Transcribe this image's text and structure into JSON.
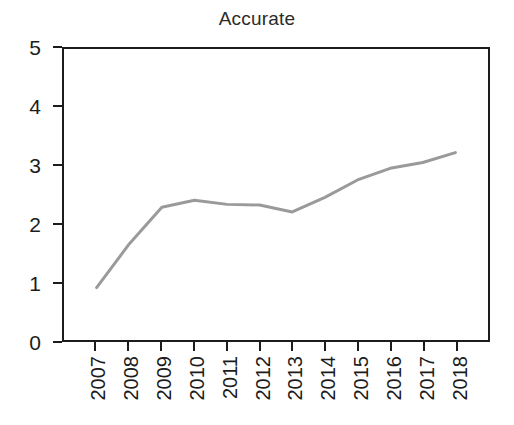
{
  "chart_data": {
    "type": "line",
    "title": "Accurate",
    "xlabel": "",
    "ylabel": "",
    "categories": [
      "2007",
      "2008",
      "2009",
      "2010",
      "2011",
      "2012",
      "2013",
      "2014",
      "2015",
      "2016",
      "2017",
      "2018"
    ],
    "values": [
      0.9,
      1.65,
      2.28,
      2.4,
      2.33,
      2.32,
      2.2,
      2.45,
      2.75,
      2.95,
      3.05,
      3.22
    ],
    "series": [
      {
        "name": "Accurate",
        "values": [
          0.9,
          1.65,
          2.28,
          2.4,
          2.33,
          2.32,
          2.2,
          2.45,
          2.75,
          2.95,
          3.05,
          3.22
        ],
        "color": "#9a9a9a"
      }
    ],
    "ylim": [
      0,
      5
    ],
    "y_ticks": [
      "0",
      "1",
      "2",
      "3",
      "4",
      "5"
    ],
    "y_tick_values": [
      0,
      1,
      2,
      3,
      4,
      5
    ],
    "xlim": [
      "2007",
      "2018"
    ],
    "grid": false,
    "legend": false,
    "legend_position": "none",
    "line_color": "#9a9a9a",
    "line_width": 3,
    "axis_color": "#1c1c1c",
    "background_color": "#ffffff",
    "markers": false
  }
}
